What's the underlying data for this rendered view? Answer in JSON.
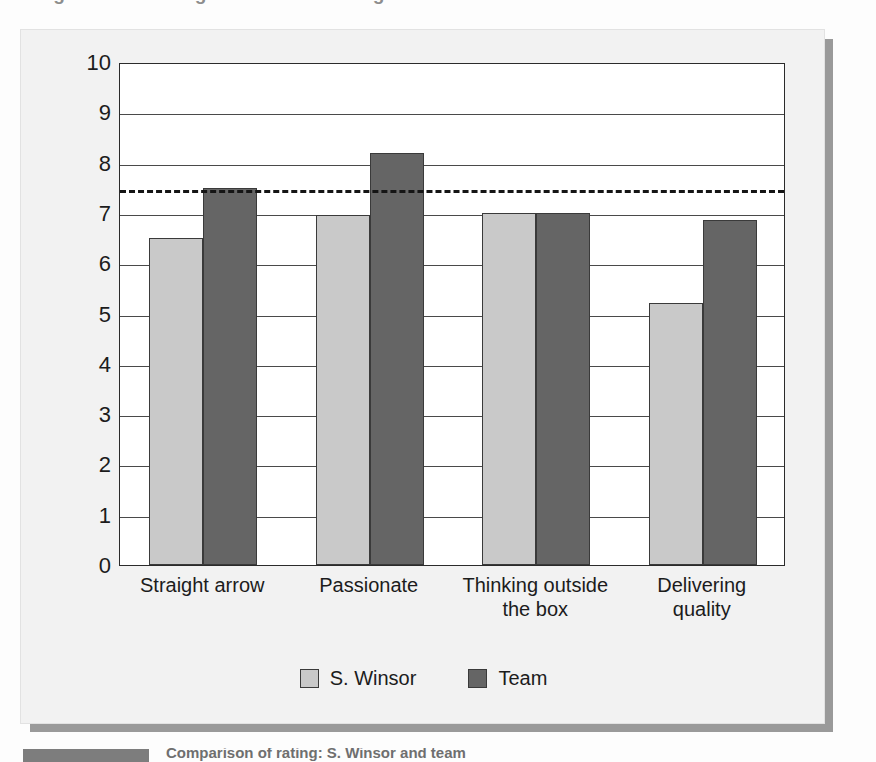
{
  "figure": {
    "title_remnant": "Figure 7.2  360-degree feedback ratings",
    "caption_label": "Comparison",
    "caption_text": "Comparison of rating: S. Winsor and team"
  },
  "legend": {
    "position": "bottom-center",
    "entries": [
      {
        "label": "S. Winsor",
        "color": "#c9c9c9",
        "swatch": "light-gray-swatch"
      },
      {
        "label": "Team",
        "color": "#656565",
        "swatch": "dark-gray-swatch"
      }
    ]
  },
  "chart_data": {
    "type": "bar",
    "title": "",
    "subtitle": "",
    "xlabel": "",
    "ylabel": "",
    "ylim": [
      0,
      10
    ],
    "yticks": [
      0,
      1,
      2,
      3,
      4,
      5,
      6,
      7,
      8,
      9,
      10
    ],
    "ytick_labels": [
      "0",
      "1",
      "2",
      "3",
      "4",
      "5",
      "6",
      "7",
      "8",
      "9",
      "10"
    ],
    "grid": true,
    "grid_axis": "y",
    "legend_position": "bottom-center",
    "categories": [
      "Straight arrow",
      "Passionate",
      "Thinking outside the box",
      "Delivering quality"
    ],
    "category_lines": [
      [
        "Straight arrow"
      ],
      [
        "Passionate"
      ],
      [
        "Thinking outside",
        "the box"
      ],
      [
        "Delivering",
        "quality"
      ]
    ],
    "series": [
      {
        "name": "S. Winsor",
        "color": "#c9c9c9",
        "values": [
          6.5,
          6.95,
          7.0,
          5.2
        ]
      },
      {
        "name": "Team",
        "color": "#656565",
        "values": [
          7.5,
          8.2,
          7.0,
          6.85
        ]
      }
    ],
    "annotations": [
      {
        "type": "reference-line",
        "orientation": "horizontal",
        "value": 7.5,
        "style": "dashed",
        "color": "#151515",
        "label": ""
      }
    ]
  }
}
